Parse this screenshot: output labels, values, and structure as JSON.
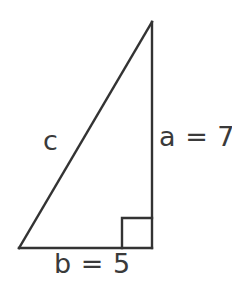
{
  "figure": {
    "kind": "right-triangle-diagram",
    "canvas": {
      "width": 232,
      "height": 284
    },
    "background_color": "#ffffff",
    "stroke_color": "#333333",
    "stroke_width": 2.4,
    "text_color": "#3a3a3a",
    "vertices": {
      "apex": {
        "x": 152,
        "y": 22
      },
      "bottom_left": {
        "x": 19,
        "y": 248
      },
      "bottom_right": {
        "x": 152,
        "y": 248
      }
    },
    "right_angle_marker": {
      "at_vertex": "bottom_right",
      "x": 122,
      "y": 218,
      "size": 30
    },
    "sides": [
      {
        "name": "hypotenuse",
        "label": "c",
        "value": ""
      },
      {
        "name": "vertical-leg",
        "label": "a = 7",
        "value": "7"
      },
      {
        "name": "horizontal-leg",
        "label": "b = 5",
        "value": "5"
      }
    ],
    "labels": {
      "hypotenuse": "c",
      "vertical_leg": "a = 7",
      "horizontal_leg": "b = 5"
    }
  }
}
